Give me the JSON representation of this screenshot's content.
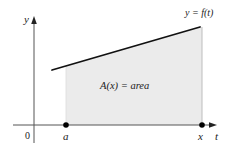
{
  "diagram": {
    "axes": {
      "vertical_label": "y",
      "horizontal_label": "t",
      "origin_label": "0"
    },
    "curve_label": "y = f(t)",
    "region_label": "A(x) = area",
    "points": [
      {
        "label": "a"
      },
      {
        "label": "x"
      }
    ],
    "colors": {
      "shaded_fill": "#ebebeb",
      "shade_edge": "#bdbdbd",
      "curve": "#111111",
      "axis": "#555555"
    }
  }
}
